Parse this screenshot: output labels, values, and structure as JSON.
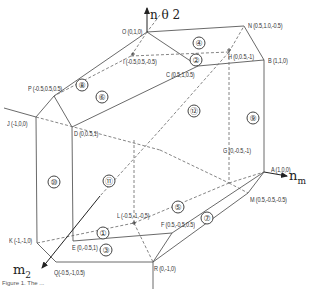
{
  "figure": {
    "axes": {
      "n_theta2": "n θ 2",
      "n_m": "n",
      "n_m_sub": "m",
      "m2": "m",
      "m2_sub": "2"
    },
    "caption": "Figure 1.  The ...",
    "vertices": [
      {
        "id": "O",
        "label": "O (0,1,0)"
      },
      {
        "id": "N",
        "label": "N (0.5,1.0,-0.5)"
      },
      {
        "id": "B",
        "label": "B (1,1,0)"
      },
      {
        "id": "H",
        "label": "H (0,0.5,-1)"
      },
      {
        "id": "I",
        "label": "I (-0.5,0.5,-0.5)"
      },
      {
        "id": "C",
        "label": "C (0.5,1,0.5)"
      },
      {
        "id": "P",
        "label": "P (-0.5,0.5,0.5)"
      },
      {
        "id": "J",
        "label": "J (-1,0,0)"
      },
      {
        "id": "D",
        "label": "D (0,0.5,1)"
      },
      {
        "id": "G",
        "label": "G (0,-0.5,-1)"
      },
      {
        "id": "A",
        "label": "A (1,0,0)"
      },
      {
        "id": "M",
        "label": "M (0.5,-0.5,-0.5)"
      },
      {
        "id": "L",
        "label": "L (-0.5,-1,-0.5)"
      },
      {
        "id": "F",
        "label": "F (0.5,-0.5,0.5)"
      },
      {
        "id": "K",
        "label": "K (-1,-1,0)"
      },
      {
        "id": "E",
        "label": "E (0,-0.5,1)"
      },
      {
        "id": "Q",
        "label": "Q(-0.5,-1,0.5)"
      },
      {
        "id": "R",
        "label": "R (0,-1,0)"
      }
    ],
    "regions": [
      "①",
      "②",
      "③",
      "④",
      "⑤",
      "⑥",
      "⑦",
      "⑧",
      "⑨",
      "⑩",
      "⑪",
      "⑫"
    ]
  }
}
